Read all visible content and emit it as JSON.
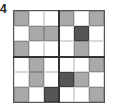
{
  "label": "4",
  "grid": {
    "rows": 6,
    "cols": 6,
    "legend": {
      "W": "white",
      "G": "gray",
      "D": "dark gray"
    },
    "colors": {
      "W": "#ffffff",
      "G": "#a9a9a9",
      "D": "#555555"
    },
    "cells": [
      [
        "G",
        "W",
        "W",
        "G",
        "W",
        "G"
      ],
      [
        "W",
        "G",
        "G",
        "W",
        "D",
        "W"
      ],
      [
        "G",
        "W",
        "W",
        "W",
        "G",
        "W"
      ],
      [
        "W",
        "G",
        "W",
        "W",
        "W",
        "G"
      ],
      [
        "W",
        "G",
        "W",
        "D",
        "G",
        "W"
      ],
      [
        "G",
        "W",
        "D",
        "W",
        "W",
        "G"
      ]
    ]
  }
}
